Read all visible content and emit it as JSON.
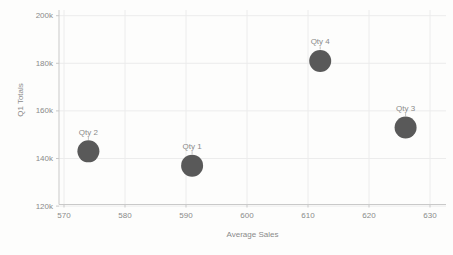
{
  "chart_data": {
    "type": "scatter",
    "title": "",
    "xlabel": "Average Sales",
    "ylabel": "Q1 Totals",
    "xlim": [
      570,
      630
    ],
    "ylim": [
      120000,
      200000
    ],
    "grid": true,
    "legend": false,
    "point_color": "#595959",
    "text_color": "#8a8a8a",
    "axis_color": "#c9c9c9",
    "grid_color": "#ececec",
    "x_ticks": [
      {
        "value": 570,
        "label": "570"
      },
      {
        "value": 580,
        "label": "580"
      },
      {
        "value": 590,
        "label": "590"
      },
      {
        "value": 600,
        "label": "600"
      },
      {
        "value": 610,
        "label": "610"
      },
      {
        "value": 620,
        "label": "620"
      },
      {
        "value": 630,
        "label": "630"
      }
    ],
    "y_ticks": [
      {
        "value": 200000,
        "label": "200k"
      },
      {
        "value": 180000,
        "label": "180k"
      },
      {
        "value": 160000,
        "label": "160k"
      },
      {
        "value": 140000,
        "label": "140k"
      },
      {
        "value": 120000,
        "label": "120k"
      }
    ],
    "points": [
      {
        "label": "Qty 2",
        "x": 574,
        "y": 143000
      },
      {
        "label": "Qty 1",
        "x": 591,
        "y": 137000
      },
      {
        "label": "Qty 4",
        "x": 612,
        "y": 181000
      },
      {
        "label": "Qty 3",
        "x": 626,
        "y": 153000
      }
    ]
  }
}
